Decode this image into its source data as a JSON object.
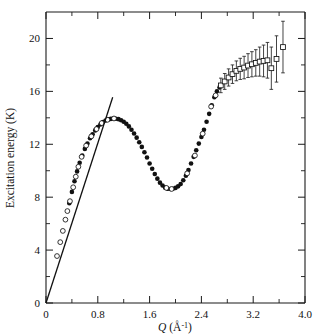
{
  "chart_data": {
    "type": "scatter",
    "title": "",
    "xlabel": "Q (Å⁻¹)",
    "xlabel_symbol": "Q",
    "xlabel_units": "(Å",
    "xlabel_exponent": "-1",
    "xlabel_units_close": ")",
    "ylabel": "Excitation energy (K)",
    "xlim": [
      0,
      4.0
    ],
    "ylim": [
      0,
      22
    ],
    "grid": false,
    "legend": "none",
    "xticks": [
      0,
      0.8,
      1.6,
      2.4,
      3.2,
      4.0
    ],
    "xticklabels": [
      "0",
      "0.8",
      "1.6",
      "2.4",
      "3.2",
      "4.0"
    ],
    "xminorticks": [
      0.4,
      1.2,
      2.0,
      2.8,
      3.6
    ],
    "yticks": [
      0,
      4,
      8,
      12,
      16,
      20
    ],
    "yticklabels": [
      "0",
      "4",
      "8",
      "12",
      "16",
      "20"
    ],
    "yminorticks": [
      2,
      6,
      10,
      14,
      18
    ],
    "series": [
      {
        "name": "phonon-roton dispersion (filled circles)",
        "marker": "filled-circle",
        "points": [
          [
            0.36,
            7.55
          ],
          [
            0.4,
            8.4
          ],
          [
            0.44,
            9.2
          ],
          [
            0.48,
            9.95
          ],
          [
            0.52,
            10.6
          ],
          [
            0.56,
            11.15
          ],
          [
            0.6,
            11.65
          ],
          [
            0.64,
            12.05
          ],
          [
            0.68,
            12.45
          ],
          [
            0.72,
            12.75
          ],
          [
            0.76,
            13.05
          ],
          [
            0.8,
            13.3
          ],
          [
            0.84,
            13.5
          ],
          [
            0.88,
            13.68
          ],
          [
            0.92,
            13.8
          ],
          [
            0.96,
            13.88
          ],
          [
            1.0,
            13.92
          ],
          [
            1.04,
            13.95
          ],
          [
            1.08,
            13.93
          ],
          [
            1.12,
            13.9
          ],
          [
            1.16,
            13.82
          ],
          [
            1.2,
            13.7
          ],
          [
            1.24,
            13.55
          ],
          [
            1.28,
            13.35
          ],
          [
            1.32,
            13.1
          ],
          [
            1.36,
            12.82
          ],
          [
            1.4,
            12.5
          ],
          [
            1.44,
            12.15
          ],
          [
            1.48,
            11.8
          ],
          [
            1.52,
            11.4
          ],
          [
            1.56,
            11.0
          ],
          [
            1.6,
            10.55
          ],
          [
            1.64,
            10.15
          ],
          [
            1.68,
            9.75
          ],
          [
            1.72,
            9.4
          ],
          [
            1.76,
            9.1
          ],
          [
            1.8,
            8.88
          ],
          [
            1.84,
            8.72
          ],
          [
            1.88,
            8.64
          ],
          [
            1.92,
            8.62
          ],
          [
            1.96,
            8.64
          ],
          [
            2.0,
            8.7
          ],
          [
            2.04,
            8.82
          ],
          [
            2.08,
            9.0
          ],
          [
            2.12,
            9.28
          ],
          [
            2.16,
            9.62
          ],
          [
            2.2,
            10.05
          ],
          [
            2.24,
            10.55
          ],
          [
            2.28,
            11.05
          ],
          [
            2.32,
            11.55
          ],
          [
            2.36,
            12.05
          ],
          [
            2.4,
            12.55
          ],
          [
            2.44,
            13.1
          ],
          [
            2.48,
            13.7
          ],
          [
            2.52,
            14.3
          ],
          [
            2.56,
            14.95
          ],
          [
            2.6,
            15.55
          ],
          [
            2.64,
            16.0
          ],
          [
            2.68,
            16.3
          ]
        ]
      },
      {
        "name": "low-Q data (open circles)",
        "marker": "open-circle",
        "points": [
          [
            0.17,
            3.55
          ],
          [
            0.22,
            4.6
          ],
          [
            0.26,
            5.45
          ],
          [
            0.3,
            6.3
          ],
          [
            0.33,
            6.95
          ],
          [
            0.37,
            7.7
          ],
          [
            0.42,
            8.75
          ],
          [
            0.46,
            9.55
          ],
          [
            0.5,
            10.3
          ],
          [
            0.55,
            11.05
          ],
          [
            0.62,
            11.9
          ],
          [
            0.7,
            12.6
          ],
          [
            0.78,
            13.15
          ],
          [
            0.86,
            13.6
          ],
          [
            0.95,
            13.85
          ],
          [
            1.05,
            13.95
          ],
          [
            1.86,
            8.7
          ],
          [
            1.94,
            8.62
          ],
          [
            2.18,
            9.8
          ],
          [
            2.3,
            11.15
          ],
          [
            2.42,
            12.8
          ],
          [
            2.55,
            14.85
          ],
          [
            2.62,
            15.7
          ]
        ]
      },
      {
        "name": "high-Q data (open squares with error bars)",
        "marker": "open-square",
        "points": [
          [
            2.7,
            16.45
          ],
          [
            2.76,
            16.75
          ],
          [
            2.82,
            17.05
          ],
          [
            2.88,
            17.3
          ],
          [
            2.94,
            17.55
          ],
          [
            3.0,
            17.7
          ],
          [
            3.06,
            17.8
          ],
          [
            3.12,
            17.95
          ],
          [
            3.18,
            18.05
          ],
          [
            3.24,
            18.15
          ],
          [
            3.3,
            18.25
          ],
          [
            3.36,
            18.3
          ],
          [
            3.42,
            18.35
          ],
          [
            3.48,
            17.75
          ],
          [
            3.56,
            18.45
          ],
          [
            3.66,
            19.35
          ]
        ],
        "errors": [
          0.55,
          0.6,
          0.65,
          0.7,
          0.75,
          0.8,
          0.85,
          0.9,
          0.95,
          1.0,
          1.1,
          1.2,
          1.35,
          1.6,
          1.75,
          1.95
        ]
      },
      {
        "name": "linear phonon fit",
        "marker": "line",
        "points": [
          [
            0.0,
            0.0
          ],
          [
            1.03,
            15.55
          ]
        ]
      }
    ]
  }
}
